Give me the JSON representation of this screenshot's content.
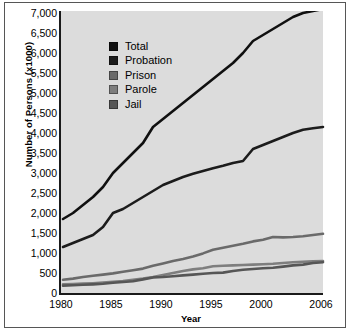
{
  "chart_data": {
    "type": "line",
    "title": "",
    "xlabel": "Year",
    "ylabel": "Number of Persons (x1000)",
    "xlim": [
      1980,
      2006
    ],
    "ylim": [
      0,
      7000
    ],
    "ytick_step": 500,
    "grid": false,
    "legend_position": "upper-left-inside",
    "xticks": [
      1980,
      1985,
      1990,
      1995,
      2000,
      2006
    ],
    "xtick_labels": [
      "1980",
      "1985",
      "1990",
      "1995",
      "2000",
      "2006"
    ],
    "ytick_labels": [
      "0",
      "500",
      "1,000",
      "1,500",
      "2,000",
      "2,500",
      "3,000",
      "3,500",
      "4,000",
      "4,500",
      "5,000",
      "5,500",
      "6,000",
      "6,500",
      "7,000"
    ],
    "yticks": [
      0,
      500,
      1000,
      1500,
      2000,
      2500,
      3000,
      3500,
      4000,
      4500,
      5000,
      5500,
      6000,
      6500,
      7000
    ],
    "x": [
      1980,
      1981,
      1982,
      1983,
      1984,
      1985,
      1986,
      1987,
      1988,
      1989,
      1990,
      1991,
      1992,
      1993,
      1994,
      1995,
      1996,
      1997,
      1998,
      1999,
      2000,
      2001,
      2002,
      2003,
      2004,
      2005,
      2006
    ],
    "series": [
      {
        "name": "Total",
        "color": "#101010",
        "values": [
          1850,
          2000,
          2200,
          2400,
          2650,
          3000,
          3250,
          3500,
          3750,
          4150,
          4350,
          4550,
          4750,
          4950,
          5150,
          5350,
          5550,
          5750,
          6000,
          6300,
          6450,
          6600,
          6750,
          6900,
          7000,
          7050,
          7100
        ]
      },
      {
        "name": "Probation",
        "color": "#1c1c1c",
        "values": [
          1150,
          1250,
          1350,
          1450,
          1650,
          2000,
          2100,
          2250,
          2400,
          2550,
          2700,
          2800,
          2900,
          2980,
          3050,
          3120,
          3180,
          3250,
          3300,
          3600,
          3700,
          3800,
          3900,
          4000,
          4080,
          4120,
          4150
        ]
      },
      {
        "name": "Prison",
        "color": "#6a6a6a",
        "values": [
          330,
          360,
          400,
          430,
          460,
          490,
          530,
          570,
          610,
          680,
          740,
          800,
          850,
          910,
          990,
          1080,
          1130,
          1180,
          1230,
          1290,
          1330,
          1400,
          1390,
          1400,
          1420,
          1450,
          1480
        ]
      },
      {
        "name": "Parole",
        "color": "#7e7e7e",
        "values": [
          220,
          225,
          235,
          245,
          260,
          280,
          300,
          330,
          360,
          400,
          450,
          500,
          550,
          590,
          620,
          670,
          680,
          690,
          700,
          710,
          720,
          730,
          750,
          770,
          780,
          790,
          800
        ]
      },
      {
        "name": "Jail",
        "color": "#565656",
        "values": [
          185,
          195,
          205,
          215,
          230,
          255,
          275,
          295,
          340,
          390,
          400,
          420,
          440,
          460,
          480,
          500,
          510,
          550,
          580,
          600,
          620,
          630,
          660,
          690,
          710,
          750,
          770
        ]
      }
    ],
    "legend": [
      {
        "label": "Total",
        "color": "#101010"
      },
      {
        "label": "Probation",
        "color": "#1c1c1c"
      },
      {
        "label": "Prison",
        "color": "#6a6a6a"
      },
      {
        "label": "Parole",
        "color": "#7e7e7e"
      },
      {
        "label": "Jail",
        "color": "#565656"
      }
    ]
  },
  "style": {
    "plot_background": "#dcdcdc",
    "figure_background": "#ffffff",
    "axis_color": "#1a1a1a",
    "border_color": "#565656"
  }
}
